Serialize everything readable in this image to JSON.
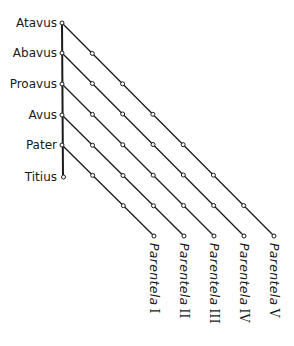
{
  "generations": [
    {
      "label": "Atavus",
      "y": 23
    },
    {
      "label": "Abavus",
      "y": 53
    },
    {
      "label": "Proavus",
      "y": 84
    },
    {
      "label": "Avus",
      "y": 115
    },
    {
      "label": "Pater",
      "y": 145
    },
    {
      "label": "Titius",
      "y": 177
    }
  ],
  "parentelae": [
    {
      "label": "Parentela",
      "numeral": "I",
      "x": 154
    },
    {
      "label": "Parentela",
      "numeral": "II",
      "x": 184
    },
    {
      "label": "Parentela",
      "numeral": "III",
      "x": 214
    },
    {
      "label": "Parentela",
      "numeral": "IV",
      "x": 244
    },
    {
      "label": "Parentela",
      "numeral": "V",
      "x": 274
    }
  ],
  "colors": {
    "line": "#1a1a1a",
    "background": "#ffffff"
  }
}
